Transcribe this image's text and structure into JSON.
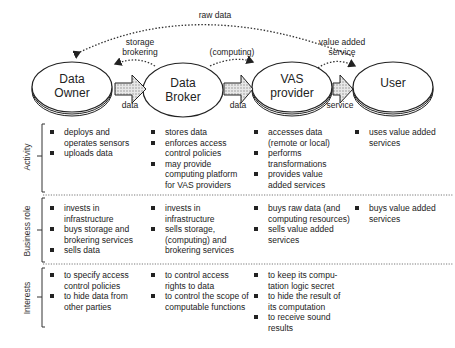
{
  "nodes": [
    {
      "id": "data-owner",
      "label_line1": "Data",
      "label_line2": "Owner"
    },
    {
      "id": "data-broker",
      "label_line1": "Data",
      "label_line2": "Broker"
    },
    {
      "id": "vas-provider",
      "label_line1": "VAS",
      "label_line2": "provider"
    },
    {
      "id": "user",
      "label_line1": "User",
      "label_line2": ""
    }
  ],
  "flows": {
    "raw_data": "raw data",
    "storage_brokering_line1": "storage",
    "storage_brokering_line2": "brokering",
    "computing": "(computing)",
    "value_added_line1": "value added",
    "value_added_line2": "service",
    "arrow1": "data",
    "arrow2": "data",
    "arrow3": "service"
  },
  "rows": [
    {
      "title": "Activity",
      "cells": [
        [
          "deploys and operates sensors",
          "uploads data"
        ],
        [
          "stores data",
          "enforces access control policies",
          "may provide computing platform for VAS providers"
        ],
        [
          "accesses data (remote or local)",
          "performs transformations",
          "provides value added services"
        ],
        [
          "uses value added services"
        ]
      ]
    },
    {
      "title": "Business role",
      "cells": [
        [
          "invests in infrastructure",
          "buys storage and brokering services",
          "sells  data"
        ],
        [
          "invests in infrastructure",
          "sells  storage, (computing) and brokering services"
        ],
        [
          "buys raw data (and computing resources)",
          "sells  value added services"
        ],
        [
          "buys value added services"
        ]
      ]
    },
    {
      "title": "Interests",
      "cells": [
        [
          "to specify access control policies",
          "to hide data from other parties"
        ],
        [
          "to control access rights to data",
          "to control the scope of computable functions"
        ],
        [
          "to keep its compu-tation logic secret",
          "to hide the result of its computation",
          "to receive sound results"
        ],
        []
      ]
    }
  ]
}
